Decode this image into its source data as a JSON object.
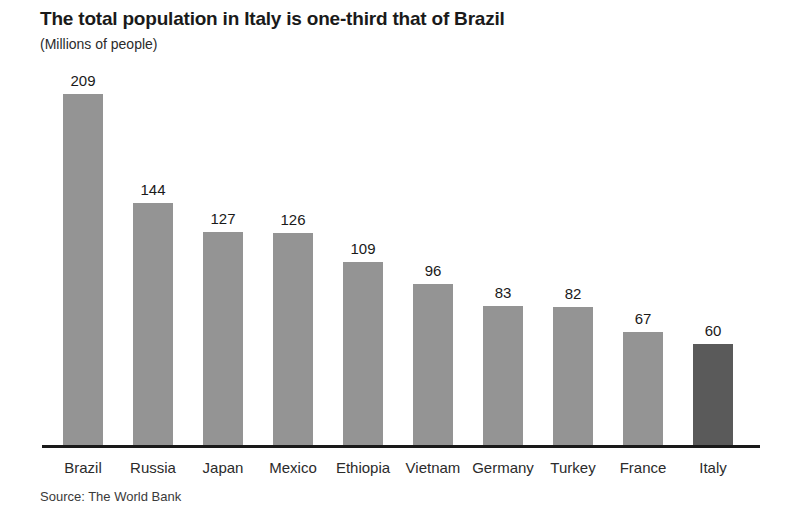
{
  "chart_data": {
    "type": "bar",
    "title": "The total population in Italy is one-third that of Brazil",
    "subtitle": "(Millions of people)",
    "source": "Source: The World Bank",
    "xlabel": "",
    "ylabel": "",
    "ylim": [
      0,
      209
    ],
    "grid": false,
    "legend": null,
    "categories": [
      "Brazil",
      "Russia",
      "Japan",
      "Mexico",
      "Ethiopia",
      "Vietnam",
      "Germany",
      "Turkey",
      "France",
      "Italy"
    ],
    "values": [
      209,
      144,
      127,
      126,
      109,
      96,
      83,
      82,
      67,
      60
    ],
    "value_labels": [
      "209",
      "144",
      "127",
      "126",
      "109",
      "96",
      "83",
      "82",
      "67",
      "60"
    ],
    "bar_color": "#949494",
    "highlight_color": "#5a5a5a",
    "highlight_category": "Italy",
    "axis_color": "#1a1a1a",
    "background": "#ffffff",
    "bars": [
      {
        "category": "Brazil",
        "value": 209,
        "label": "209",
        "color": "#949494",
        "highlighted": false
      },
      {
        "category": "Russia",
        "value": 144,
        "label": "144",
        "color": "#949494",
        "highlighted": false
      },
      {
        "category": "Japan",
        "value": 127,
        "label": "127",
        "color": "#949494",
        "highlighted": false
      },
      {
        "category": "Mexico",
        "value": 126,
        "label": "126",
        "color": "#949494",
        "highlighted": false
      },
      {
        "category": "Ethiopia",
        "value": 109,
        "label": "109",
        "color": "#949494",
        "highlighted": false
      },
      {
        "category": "Vietnam",
        "value": 96,
        "label": "96",
        "color": "#949494",
        "highlighted": false
      },
      {
        "category": "Germany",
        "value": 83,
        "label": "83",
        "color": "#949494",
        "highlighted": false
      },
      {
        "category": "Turkey",
        "value": 82,
        "label": "82",
        "color": "#949494",
        "highlighted": false
      },
      {
        "category": "France",
        "value": 67,
        "label": "67",
        "color": "#949494",
        "highlighted": false
      },
      {
        "category": "Italy",
        "value": 60,
        "label": "60",
        "color": "#5a5a5a",
        "highlighted": true
      }
    ]
  }
}
